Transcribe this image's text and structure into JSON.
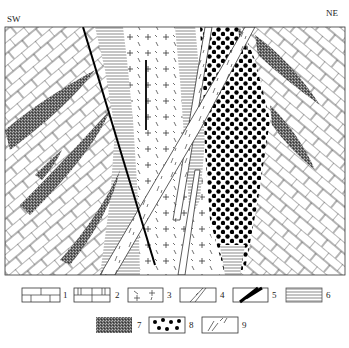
{
  "section": {
    "left_label": "SW",
    "right_label": "NE"
  },
  "legend": {
    "items": [
      {
        "num": "1",
        "pattern": "limestone"
      },
      {
        "num": "2",
        "pattern": "dolomitic-limestone"
      },
      {
        "num": "3",
        "pattern": "granite"
      },
      {
        "num": "4",
        "pattern": "dike"
      },
      {
        "num": "5",
        "pattern": "fault"
      },
      {
        "num": "6",
        "pattern": "hornfels"
      },
      {
        "num": "7",
        "pattern": "skarn"
      },
      {
        "num": "8",
        "pattern": "ore-body"
      },
      {
        "num": "9",
        "pattern": "andesite-dike"
      }
    ]
  },
  "colors": {
    "line": "#222222",
    "fill_dark": "#555555"
  }
}
